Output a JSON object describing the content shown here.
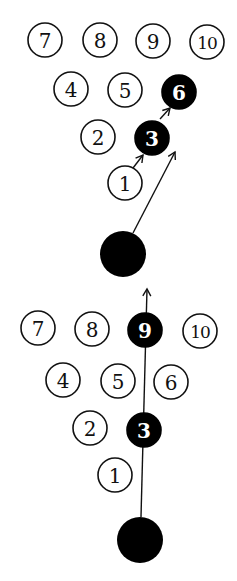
{
  "diagrams": [
    {
      "name": "pocket-hit-top",
      "pins": [
        {
          "label": "7",
          "x": 45,
          "y": 40,
          "hit": false
        },
        {
          "label": "8",
          "x": 100,
          "y": 40,
          "hit": false
        },
        {
          "label": "9",
          "x": 153,
          "y": 41,
          "hit": false
        },
        {
          "label": "10",
          "x": 207,
          "y": 42,
          "hit": false
        },
        {
          "label": "4",
          "x": 71,
          "y": 89,
          "hit": false
        },
        {
          "label": "5",
          "x": 125,
          "y": 90,
          "hit": false
        },
        {
          "label": "6",
          "x": 179,
          "y": 92,
          "hit": true
        },
        {
          "label": "2",
          "x": 98,
          "y": 137,
          "hit": false
        },
        {
          "label": "3",
          "x": 152,
          "y": 138,
          "hit": true
        },
        {
          "label": "1",
          "x": 125,
          "y": 183,
          "hit": false
        }
      ],
      "ball": {
        "x": 123,
        "y": 254,
        "r": 23
      },
      "arrows": [
        {
          "from": [
            133,
            233
          ],
          "to": [
            175,
            152
          ]
        },
        {
          "from": [
            133,
            168
          ],
          "to": [
            143,
            155
          ]
        },
        {
          "from": [
            160,
            119
          ],
          "to": [
            170,
            108
          ]
        }
      ]
    },
    {
      "name": "pocket-hit-bottom",
      "pins": [
        {
          "label": "7",
          "x": 38,
          "y": 328,
          "hit": false
        },
        {
          "label": "8",
          "x": 92,
          "y": 329,
          "hit": false
        },
        {
          "label": "9",
          "x": 145,
          "y": 330,
          "hit": true
        },
        {
          "label": "10",
          "x": 200,
          "y": 331,
          "hit": false
        },
        {
          "label": "4",
          "x": 63,
          "y": 380,
          "hit": false
        },
        {
          "label": "5",
          "x": 118,
          "y": 381,
          "hit": false
        },
        {
          "label": "6",
          "x": 171,
          "y": 382,
          "hit": false
        },
        {
          "label": "2",
          "x": 90,
          "y": 428,
          "hit": false
        },
        {
          "label": "3",
          "x": 144,
          "y": 430,
          "hit": true
        },
        {
          "label": "1",
          "x": 115,
          "y": 475,
          "hit": false
        }
      ],
      "ball": {
        "x": 140,
        "y": 540,
        "r": 23
      },
      "arrows": [
        {
          "from": [
            141,
            517
          ],
          "to": [
            147,
            289
          ]
        }
      ]
    }
  ],
  "colors": {
    "ink": "#111111",
    "background": "#ffffff",
    "hit_fill": "#000000"
  }
}
